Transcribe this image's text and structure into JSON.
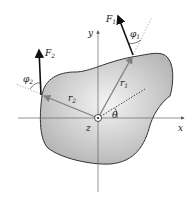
{
  "diagram": {
    "axes": {
      "x_label": "x",
      "y_label": "y",
      "z_label": "z"
    },
    "forces": [
      {
        "name": "F",
        "sub": "1",
        "angle_label": "φ",
        "angle_sub": "1",
        "position_label": "r",
        "position_sub": "1"
      },
      {
        "name": "F",
        "sub": "2",
        "angle_label": "φ",
        "angle_sub": "2",
        "position_label": "r",
        "position_sub": "2"
      }
    ],
    "rotation_angle_label": "θ",
    "colors": {
      "body_fill_light": "#f2f2f2",
      "body_fill_dark": "#b8b8b8",
      "outline": "#333333",
      "radius_arrow": "#808080",
      "force_arrow": "#111111"
    }
  }
}
